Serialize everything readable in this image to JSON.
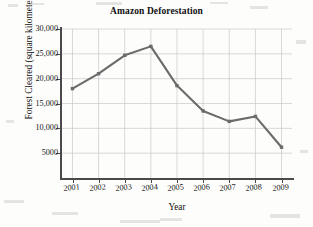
{
  "chart_data": {
    "type": "line",
    "title": "Amazon Deforestation",
    "xlabel": "Year",
    "ylabel": "Forest Cleared (square kilometers)",
    "categories": [
      "2001",
      "2002",
      "2003",
      "2004",
      "2005",
      "2006",
      "2007",
      "2008",
      "2009"
    ],
    "values": [
      18000,
      21000,
      24700,
      26500,
      18600,
      13500,
      11400,
      12400,
      6200
    ],
    "x": [
      2001,
      2002,
      2003,
      2004,
      2005,
      2006,
      2007,
      2008,
      2009
    ],
    "xlim": [
      2000.6,
      2009.4
    ],
    "ylim": [
      0,
      30000
    ],
    "ytick_values": [
      5000,
      10000,
      15000,
      20000,
      25000,
      30000
    ],
    "ytick_labels": [
      "5000",
      "10,000",
      "15,000",
      "20,000",
      "25,000",
      "30,000"
    ],
    "xtick_labels": [
      "2001",
      "2002",
      "2003",
      "2004",
      "2005",
      "2006",
      "2007",
      "2008",
      "2009"
    ],
    "grid": true,
    "legend": false,
    "series_color": "#6b6b6b",
    "grid_color": "#c9c9c9",
    "axis_color": "#4a4a4a",
    "marker": "square"
  },
  "figure": {
    "background_color": "#fdfdfc"
  }
}
